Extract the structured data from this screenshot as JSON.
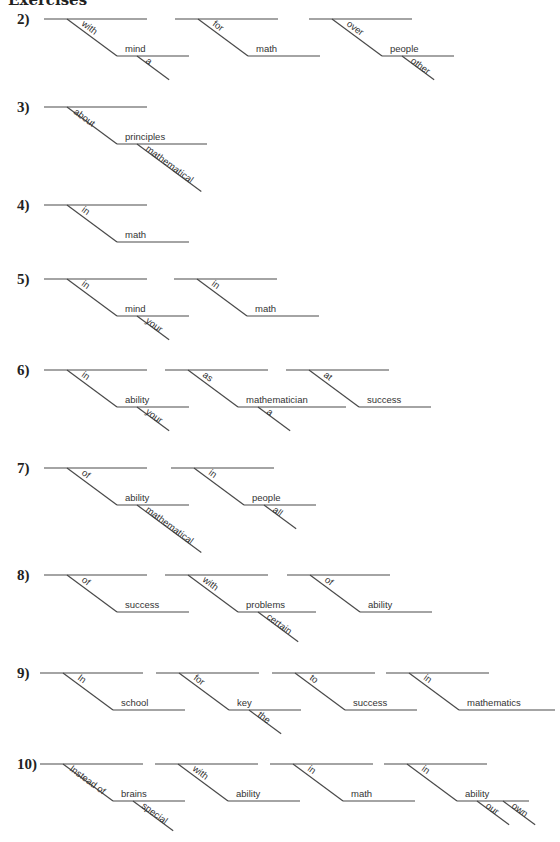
{
  "header": {
    "title": "Exercises"
  },
  "exercises": [
    {
      "number": "2)",
      "y": 19,
      "diagrams": [
        {
          "x": 44,
          "prep": "with",
          "object": "mind",
          "mods": [
            "a"
          ]
        },
        {
          "x": 175,
          "prep": "for",
          "object": "math",
          "mods": []
        },
        {
          "x": 309,
          "prep": "over",
          "object": "people",
          "mods": [
            "other"
          ]
        }
      ]
    },
    {
      "number": "3)",
      "y": 107,
      "diagrams": [
        {
          "x": 44,
          "prep": "about",
          "object": "principles",
          "mods": [
            "mathematical"
          ]
        }
      ]
    },
    {
      "number": "4)",
      "y": 205,
      "diagrams": [
        {
          "x": 44,
          "prep": "in",
          "object": "math",
          "mods": []
        }
      ]
    },
    {
      "number": "5)",
      "y": 279,
      "diagrams": [
        {
          "x": 44,
          "prep": "in",
          "object": "mind",
          "mods": [
            "your"
          ]
        },
        {
          "x": 174,
          "prep": "in",
          "object": "math",
          "mods": []
        }
      ]
    },
    {
      "number": "6)",
      "y": 370,
      "diagrams": [
        {
          "x": 44,
          "prep": "in",
          "object": "ability",
          "mods": [
            "your"
          ]
        },
        {
          "x": 165,
          "prep": "as",
          "object": "mathematician",
          "mods": [
            "a"
          ]
        },
        {
          "x": 286,
          "prep": "at",
          "object": "success",
          "mods": []
        }
      ]
    },
    {
      "number": "7)",
      "y": 468,
      "diagrams": [
        {
          "x": 44,
          "prep": "of",
          "object": "ability",
          "mods": [
            "mathematical"
          ]
        },
        {
          "x": 171,
          "prep": "in",
          "object": "people",
          "mods": [
            "all"
          ]
        }
      ]
    },
    {
      "number": "8)",
      "y": 575,
      "diagrams": [
        {
          "x": 44,
          "prep": "of",
          "object": "success",
          "mods": []
        },
        {
          "x": 165,
          "prep": "with",
          "object": "problems",
          "mods": [
            "certain"
          ]
        },
        {
          "x": 287,
          "prep": "of",
          "object": "ability",
          "mods": []
        }
      ]
    },
    {
      "number": "9)",
      "y": 673,
      "diagrams": [
        {
          "x": 40,
          "prep": "In",
          "object": "school",
          "mods": []
        },
        {
          "x": 156,
          "prep": "for",
          "object": "key",
          "mods": [
            "the"
          ]
        },
        {
          "x": 272,
          "prep": "to",
          "object": "success",
          "mods": []
        },
        {
          "x": 386,
          "prep": "in",
          "object": "mathematics",
          "mods": []
        }
      ]
    },
    {
      "number": "10)",
      "y": 764,
      "diagrams": [
        {
          "x": 40,
          "prep": "Instead of",
          "object": "brains",
          "mods": [
            "special"
          ]
        },
        {
          "x": 155,
          "prep": "with",
          "object": "ability",
          "mods": []
        },
        {
          "x": 270,
          "prep": "in",
          "object": "math",
          "mods": []
        },
        {
          "x": 384,
          "prep": "in",
          "object": "ability",
          "mods": [
            "our",
            "own"
          ]
        }
      ]
    }
  ]
}
